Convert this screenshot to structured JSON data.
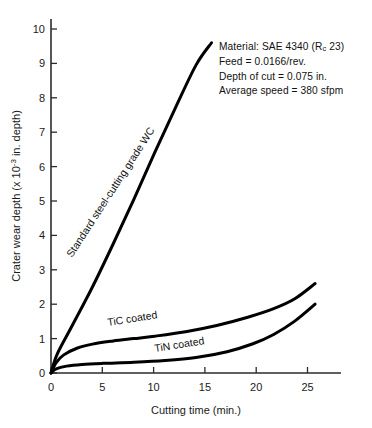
{
  "chart_data": {
    "type": "line",
    "title": "",
    "xlabel": "Cutting time (min.)",
    "ylabel": "Crater wear depth  (x 10-3 in. depth)",
    "ylabel_parts": {
      "lead": "Crater wear depth  (x 10",
      "exponent": "-3",
      "tail": " in. depth)"
    },
    "xlim": [
      0,
      28
    ],
    "ylim": [
      0,
      10
    ],
    "xticks": [
      0,
      5,
      10,
      15,
      20,
      25
    ],
    "xtick_labels": [
      "0",
      "5",
      "10",
      "15",
      "20",
      "25"
    ],
    "yticks": [
      0,
      1,
      2,
      3,
      4,
      5,
      6,
      7,
      8,
      9,
      10
    ],
    "ytick_labels": [
      "0",
      "1",
      "2",
      "3",
      "4",
      "5",
      "6",
      "7",
      "8",
      "9",
      "10"
    ],
    "grid": false,
    "legend_position": "inline-curve-labels",
    "series": [
      {
        "name": "Standard steel-cutting grade WC",
        "label_rotation_deg": -57,
        "x": [
          0,
          0.6,
          2,
          4,
          6,
          8,
          10,
          12,
          14,
          15.5
        ],
        "y": [
          0,
          0.55,
          1.35,
          2.5,
          3.75,
          5.05,
          6.4,
          7.7,
          8.95,
          9.6
        ]
      },
      {
        "name": "TiC coated",
        "label_rotation_deg": -9,
        "x": [
          0,
          0.5,
          1.2,
          2.5,
          4,
          6,
          8,
          10,
          13,
          16,
          19,
          21.5,
          23.5,
          25.5
        ],
        "y": [
          0,
          0.3,
          0.52,
          0.72,
          0.84,
          0.93,
          1.0,
          1.07,
          1.2,
          1.38,
          1.62,
          1.87,
          2.15,
          2.6
        ]
      },
      {
        "name": "TiN coated",
        "label_rotation_deg": -9,
        "x": [
          0,
          0.5,
          1.5,
          3,
          5,
          8,
          11,
          14,
          17,
          19.5,
          21.5,
          23.5,
          25.5
        ],
        "y": [
          0,
          0.12,
          0.2,
          0.25,
          0.28,
          0.31,
          0.36,
          0.45,
          0.62,
          0.85,
          1.12,
          1.5,
          2.0
        ]
      }
    ],
    "annotations": [
      "Material:  SAE 4340 (Rc 23)",
      "Feed = 0.0166/rev.",
      "Depth of cut = 0.075 in.",
      "Average speed = 380 sfpm"
    ]
  },
  "annotation": {
    "line1_prefix": "Material:  SAE 4340 (R",
    "line1_sub": "c",
    "line1_suffix": " 23)",
    "line2": "Feed = 0.0166/rev.",
    "line3": "Depth of cut = 0.075 in.",
    "line4": "Average speed = 380 sfpm"
  },
  "curve_labels": {
    "wc": "Standard steel-cutting grade WC",
    "tic": "TiC coated",
    "tin": "TiN coated"
  },
  "axes": {
    "x_title": "Cutting time (min.)",
    "y_title_lead": "Crater wear depth  (x 10",
    "y_title_exp": "-3",
    "y_title_tail": " in. depth)"
  }
}
